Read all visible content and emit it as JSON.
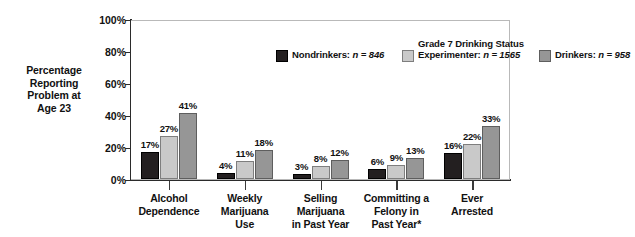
{
  "chart_data": {
    "type": "bar",
    "title": "",
    "xlabel": "",
    "ylabel": "Percentage Reporting Problem at Age 23",
    "ylim": [
      0,
      100
    ],
    "ytick_labels": [
      "0%",
      "20%",
      "40%",
      "60%",
      "80%",
      "100%"
    ],
    "ytick_values": [
      0,
      20,
      40,
      60,
      80,
      100
    ],
    "grid": false,
    "legend_position": "top-inside",
    "legend_title": "Grade 7 Drinking Status",
    "categories": [
      "Alcohol Dependence",
      "Weekly Marijuana Use",
      "Selling Marijuana in Past Year",
      "Committing a Felony in Past Year*",
      "Ever Arrested"
    ],
    "category_lines": [
      [
        "Alcohol",
        "Dependence"
      ],
      [
        "Weekly",
        "Marijuana",
        "Use"
      ],
      [
        "Selling",
        "Marijuana",
        "in Past Year"
      ],
      [
        "Committing a",
        "Felony in",
        "Past Year*"
      ],
      [
        "Ever",
        "Arrested"
      ]
    ],
    "series": [
      {
        "name": "Nondrinkers",
        "n": 846,
        "color": "#231f20",
        "values": [
          17,
          4,
          3,
          6,
          16
        ],
        "value_labels": [
          "17%",
          "4%",
          "3%",
          "6%",
          "16%"
        ]
      },
      {
        "name": "Experimenter",
        "n": 1565,
        "color": "#c9c9c9",
        "values": [
          27,
          11,
          8,
          9,
          22
        ],
        "value_labels": [
          "27%",
          "11%",
          "8%",
          "9%",
          "22%"
        ]
      },
      {
        "name": "Drinkers",
        "n": 958,
        "color": "#969696",
        "values": [
          41,
          18,
          12,
          13,
          33
        ],
        "value_labels": [
          "41%",
          "18%",
          "12%",
          "13%",
          "33%"
        ]
      }
    ]
  },
  "ytitle": {
    "lines": [
      "Percentage",
      "Reporting",
      "Problem at",
      "Age 23"
    ]
  },
  "legend": {
    "title": "Grade 7 Drinking Status",
    "entries": [
      {
        "label": "Nondrinkers:",
        "n_text": "n = 846"
      },
      {
        "label": "Experimenter:",
        "n_text": "n = 1565"
      },
      {
        "label": "Drinkers:",
        "n_text": "n = 958"
      }
    ]
  },
  "colors": {
    "nondrinkers": "#231f20",
    "experimenter": "#c9c9c9",
    "drinkers": "#969696",
    "axis": "#2b2b2b",
    "frame": "#b9b9b9",
    "text": "#111111",
    "background": "#ffffff"
  }
}
